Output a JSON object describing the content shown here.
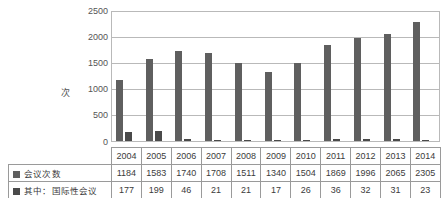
{
  "chart_data": {
    "type": "bar",
    "title": "",
    "xlabel": "",
    "ylabel": "次",
    "ylim": [
      0,
      2500
    ],
    "yticks": [
      0,
      500,
      1000,
      1500,
      2000,
      2500
    ],
    "grid": true,
    "legend_position": "table-left",
    "categories": [
      "2004",
      "2005",
      "2006",
      "2007",
      "2008",
      "2009",
      "2010",
      "2011",
      "2012",
      "2013",
      "2014"
    ],
    "series": [
      {
        "name": "会议次数",
        "color": "#5f5f5f",
        "values": [
          1184,
          1583,
          1740,
          1708,
          1511,
          1340,
          1504,
          1869,
          1996,
          2065,
          2305
        ]
      },
      {
        "name": "其中：国际性会议",
        "color": "#4a4a4a",
        "values": [
          177,
          199,
          46,
          21,
          21,
          17,
          26,
          36,
          32,
          31,
          23
        ]
      }
    ]
  },
  "axis": {
    "y_title": "次",
    "ticks": [
      "2500",
      "2000",
      "1500",
      "1000",
      "500",
      "0"
    ]
  },
  "table": {
    "year_row": [
      "2004",
      "2005",
      "2006",
      "2007",
      "2008",
      "2009",
      "2010",
      "2011",
      "2012",
      "2013",
      "2014"
    ],
    "rows": [
      {
        "label": "会议次数",
        "values": [
          "1184",
          "1583",
          "1740",
          "1708",
          "1511",
          "1340",
          "1504",
          "1869",
          "1996",
          "2065",
          "2305"
        ]
      },
      {
        "label": "其中：国际性会议",
        "values": [
          "177",
          "199",
          "46",
          "21",
          "21",
          "17",
          "26",
          "36",
          "32",
          "31",
          "23"
        ]
      }
    ]
  },
  "colors": {
    "series1": "#5f5f5f",
    "series2": "#4a4a4a",
    "grid": "#b9b9b9",
    "border": "#9a9a9a",
    "text": "#3b3b3b"
  }
}
